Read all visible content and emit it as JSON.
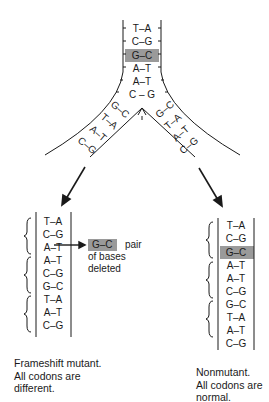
{
  "colors": {
    "ink": "#1a1a1a",
    "highlight": "#9a9a9a"
  },
  "fork": {
    "trunk_pairs": [
      "T–A",
      "C–G",
      "G–C",
      "A–T",
      "A–T",
      "C – G"
    ],
    "highlighted_index": 2,
    "gap_mark": "–",
    "left_arm_pairs": [
      "G–C",
      "T–A",
      "A–T",
      "C–G"
    ],
    "right_arm_pairs": [
      "G–C",
      "T–A",
      "A–T",
      "C–G"
    ]
  },
  "frameshift": {
    "pairs": [
      "T–A",
      "C–G",
      "A–T",
      "A–T",
      "C–G",
      "G–C",
      "T–A",
      "A–T",
      "C–G"
    ],
    "callout_box": "G–C",
    "callout_word": "pair",
    "callout_rest": [
      "of bases",
      "deleted"
    ],
    "caption": [
      "Frameshift mutant.",
      "All codons are",
      "different."
    ]
  },
  "nonmutant": {
    "pairs": [
      "T–A",
      "C–G",
      "G–C",
      "A–T",
      "A–T",
      "C–G",
      "G–C",
      "T–A",
      "A–T",
      "C–G"
    ],
    "highlighted_index": 2,
    "caption": [
      "Nonmutant.",
      "All codons are",
      "normal."
    ]
  }
}
